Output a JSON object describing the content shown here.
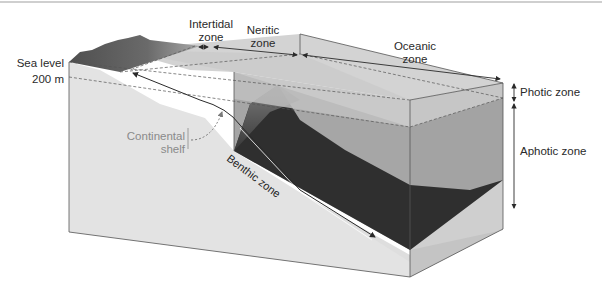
{
  "figure": {
    "type": "ocean-zones-block-diagram",
    "labels": {
      "sea_level": "Sea level",
      "depth_200m": "200 m",
      "intertidal_line1": "Intertidal",
      "intertidal_line2": "zone",
      "neritic_line1": "Neritic",
      "neritic_line2": "zone",
      "oceanic_line1": "Oceanic",
      "oceanic_line2": "zone",
      "photic": "Photic zone",
      "aphotic": "Aphotic zone",
      "continental_line1": "Continental",
      "continental_line2": "shelf",
      "benthic": "Benthic zone"
    },
    "colors": {
      "land_top": "#5e5e5e",
      "land_side": "#e6e6e6",
      "land_front": "#dcdcdc",
      "water_surface": "#cfcfcf",
      "photic_water": "#b8b8b8",
      "aphotic_water": "#9e9e9e",
      "deep_floor": "#2e2e2e",
      "line": "#3a3a3a"
    }
  }
}
